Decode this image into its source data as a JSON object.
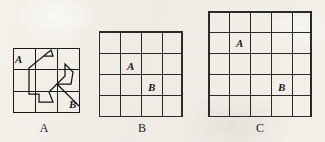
{
  "page": {
    "background_color": "#f2efe9",
    "ink_color": "#1a1a1a"
  },
  "figures": [
    {
      "id": "figure-a",
      "caption": "A",
      "grid": {
        "rows": 3,
        "cols": 3,
        "cell_size": 22,
        "width": 67,
        "height": 65
      },
      "labels": [
        {
          "text": "A",
          "position": "top-left-cell"
        },
        {
          "text": "B",
          "position": "bottom-right-outside"
        }
      ],
      "path": {
        "type": "polyline",
        "description": "zigzag route from A to B across the 3x3 grid",
        "points": "30,8 40,8 38,2 16,20 16,46 26,46 26,54 40,54 36,44 52,28 52,16 60,24 58,36 44,36 58,50 66,58"
      },
      "path_extra_segments": [
        "5,8 30,8",
        "44,36 58,50",
        "52,16 60,24"
      ]
    },
    {
      "id": "figure-b",
      "caption": "B",
      "grid": {
        "rows": 4,
        "cols": 4,
        "cell_size": 21,
        "width": 84,
        "height": 86
      },
      "labels": [
        {
          "text": "A",
          "row": 2,
          "col": 2
        },
        {
          "text": "B",
          "row": 3,
          "col": 3
        }
      ]
    },
    {
      "id": "figure-c",
      "caption": "C",
      "grid": {
        "rows": 5,
        "cols": 5,
        "cell_size": 21,
        "width": 104,
        "height": 106
      },
      "labels": [
        {
          "text": "A",
          "row": 2,
          "col": 2
        },
        {
          "text": "B",
          "row": 4,
          "col": 4
        }
      ]
    }
  ]
}
